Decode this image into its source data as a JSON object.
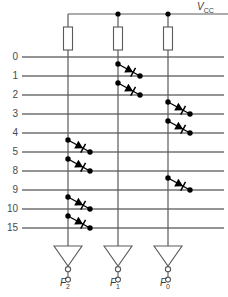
{
  "diagram": {
    "kind": "diode-matrix-rom-schematic",
    "supply_label": "V",
    "supply_sub": "CC",
    "colors": {
      "wire": "#5a5a5a",
      "wire_dark": "#2b2b2b",
      "device": "#000000",
      "text": "#3b3b3b",
      "background": "#ffffff"
    },
    "rows": [
      {
        "label": "0",
        "y": 57
      },
      {
        "label": "1",
        "y": 76
      },
      {
        "label": "2",
        "y": 95
      },
      {
        "label": "3",
        "y": 114
      },
      {
        "label": "4",
        "y": 133
      },
      {
        "label": "5",
        "y": 152
      },
      {
        "label": "8",
        "y": 171
      },
      {
        "label": "9",
        "y": 190
      },
      {
        "label": "10",
        "y": 209
      },
      {
        "label": "15",
        "y": 228
      }
    ],
    "columns": [
      {
        "name": "F2",
        "label": "F",
        "sub": "2",
        "x": 68
      },
      {
        "name": "F1",
        "label": "F",
        "sub": "1",
        "x": 118
      },
      {
        "name": "F0",
        "label": "F",
        "sub": "0",
        "x": 168
      }
    ],
    "rail": {
      "y": 14,
      "x_start": 68,
      "x_end": 228,
      "junctions": [
        118,
        168
      ]
    },
    "resistors": [
      {
        "column": "F2",
        "x": 68,
        "y_top": 27,
        "y_bottom": 50
      },
      {
        "column": "F1",
        "x": 118,
        "y_top": 27,
        "y_bottom": 50
      },
      {
        "column": "F0",
        "x": 168,
        "y_top": 27,
        "y_bottom": 50
      }
    ],
    "row_line": {
      "x_start": 22,
      "x_end": 224
    },
    "diodes": [
      {
        "column": "F1",
        "x": 118,
        "anode_row": "0",
        "cathode_row": "1",
        "anode_y": 64,
        "cathode_y": 76
      },
      {
        "column": "F1",
        "x": 118,
        "anode_row": "1",
        "cathode_row": "2",
        "anode_y": 83,
        "cathode_y": 95
      },
      {
        "column": "F0",
        "x": 168,
        "anode_row": "2",
        "cathode_row": "3",
        "anode_y": 102,
        "cathode_y": 114
      },
      {
        "column": "F0",
        "x": 168,
        "anode_row": "3",
        "cathode_row": "4",
        "anode_y": 121,
        "cathode_y": 133
      },
      {
        "column": "F2",
        "x": 68,
        "anode_row": "4",
        "cathode_row": "5",
        "anode_y": 140,
        "cathode_y": 152
      },
      {
        "column": "F2",
        "x": 68,
        "anode_row": "5",
        "cathode_row": "8",
        "anode_y": 159,
        "cathode_y": 171
      },
      {
        "column": "F0",
        "x": 168,
        "anode_row": "8",
        "cathode_row": "9",
        "anode_y": 178,
        "cathode_y": 190
      },
      {
        "column": "F2",
        "x": 68,
        "anode_row": "9",
        "cathode_row": "10",
        "anode_y": 197,
        "cathode_y": 209
      },
      {
        "column": "F2",
        "x": 68,
        "anode_row": "10",
        "cathode_row": "15",
        "anode_y": 216,
        "cathode_y": 228
      }
    ],
    "inverters": [
      {
        "column": "F2",
        "x": 68,
        "top_y": 246,
        "apex_y": 266,
        "half_width": 14
      },
      {
        "column": "F1",
        "x": 118,
        "top_y": 246,
        "apex_y": 266,
        "half_width": 14
      },
      {
        "column": "F0",
        "x": 168,
        "top_y": 246,
        "apex_y": 266,
        "half_width": 14
      }
    ],
    "outputs": [
      {
        "name": "F2",
        "label": "F",
        "sub": "2",
        "x": 68,
        "y": 283
      },
      {
        "name": "F1",
        "label": "F",
        "sub": "1",
        "x": 118,
        "y": 283
      },
      {
        "name": "F0",
        "label": "F",
        "sub": "0",
        "x": 168,
        "y": 283
      }
    ]
  }
}
